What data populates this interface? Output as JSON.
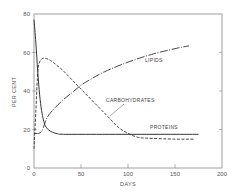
{
  "chart_data": {
    "type": "line",
    "title": "",
    "xlabel": "DAYS",
    "ylabel": "PER CENT",
    "xlim": [
      0,
      200
    ],
    "ylim": [
      0,
      80
    ],
    "x_ticks": [
      "0",
      "50",
      "100",
      "150",
      "200"
    ],
    "y_ticks": [
      "0",
      "20",
      "40",
      "60",
      "80"
    ],
    "grid": false,
    "legend": "inline curve labels",
    "series": [
      {
        "name": "PROTEINS",
        "style": "solid",
        "x": [
          0,
          2,
          4,
          6,
          8,
          10,
          12,
          15,
          20,
          25,
          30,
          50,
          100,
          150,
          175
        ],
        "y": [
          77,
          65,
          50,
          38,
          30,
          25,
          22,
          20,
          18.5,
          17.8,
          17.5,
          17.5,
          17.5,
          17.5,
          17.5
        ]
      },
      {
        "name": "CARBOHYDRATES",
        "style": "dashed",
        "x": [
          0,
          2,
          4,
          6,
          8,
          10,
          12,
          15,
          20,
          30,
          40,
          50,
          60,
          70,
          80,
          90,
          100,
          110,
          120,
          150,
          170
        ],
        "y": [
          10,
          30,
          50,
          55,
          56.5,
          57,
          57,
          56.5,
          55,
          51,
          46,
          41,
          36,
          31,
          26,
          21,
          18,
          16,
          15.5,
          15,
          15
        ]
      },
      {
        "name": "LIPIDS",
        "style": "dash-dot",
        "x": [
          0,
          5,
          8,
          10,
          12,
          15,
          20,
          30,
          40,
          50,
          60,
          75,
          100,
          125,
          150,
          165
        ],
        "y": [
          18,
          18,
          19,
          21,
          24,
          27,
          30,
          35,
          39,
          43,
          46,
          50,
          55,
          59,
          62,
          63.5
        ]
      }
    ],
    "annotations": [
      {
        "text": "LIPIDS",
        "x": 113,
        "y": 58
      },
      {
        "text": "CARBOHYDRATES",
        "x": 90,
        "y": 35
      },
      {
        "text": "PROTEINS",
        "x": 115,
        "y": 20
      }
    ]
  },
  "labels": {
    "x_axis": "DAYS",
    "y_axis": "PER CENT",
    "lipids": "LIPIDS",
    "carbohydrates": "CARBOHYDRATES",
    "proteins": "PROTEINS",
    "x_ticks": [
      "0",
      "50",
      "100",
      "150",
      "200"
    ],
    "y_ticks": [
      "0",
      "20",
      "40",
      "60",
      "80"
    ]
  }
}
